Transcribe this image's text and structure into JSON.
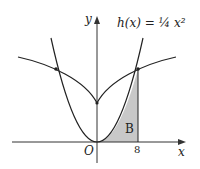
{
  "diagram": {
    "function_label": "h(x) = ¼ x²",
    "y_axis_label": "y",
    "x_axis_label": "x",
    "origin_label": "O",
    "x_tick_label": "8",
    "region_label": "B",
    "colors": {
      "curve": "#222222",
      "shade": "#c8c8c8",
      "axis": "#333333"
    }
  }
}
